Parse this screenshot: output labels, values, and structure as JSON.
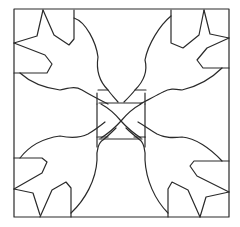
{
  "title": "Quilt block line-art pattern",
  "colors": {
    "background": "#ffffff",
    "stroke": "#2a2a2a"
  },
  "elements": {
    "outer_border": "square-border",
    "center": "center-square-with-x",
    "birds": [
      "top-left-bird",
      "top-right-bird",
      "bottom-left-bird",
      "bottom-right-bird"
    ]
  }
}
